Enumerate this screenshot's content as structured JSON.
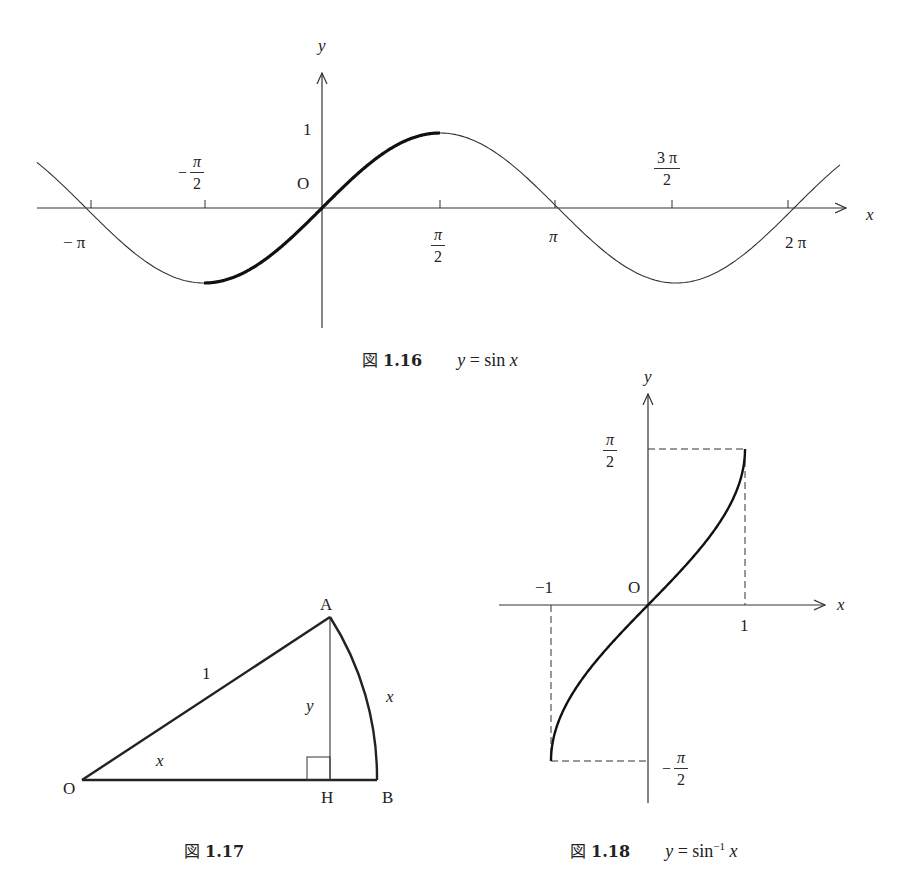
{
  "figures": {
    "fig116": {
      "caption_prefix": "図",
      "caption_number": "1.16",
      "caption_eq_lhs": "y",
      "caption_eq_rhs": " = sin ",
      "caption_eq_var": "x",
      "axis_x_label": "x",
      "axis_y_label": "y",
      "origin_label": "O",
      "y_tick_label": "1",
      "x_ticks": {
        "neg_pi": "− π",
        "neg_half_pi_sign": "−",
        "neg_half_pi_num": "π",
        "neg_half_pi_den": "2",
        "half_pi_num": "π",
        "half_pi_den": "2",
        "pi": "π",
        "three_half_pi_num": "3 π",
        "three_half_pi_den": "2",
        "two_pi": "2 π"
      }
    },
    "fig117": {
      "caption_prefix": "図",
      "caption_number": "1.17",
      "points": {
        "O": "O",
        "A": "A",
        "H": "H",
        "B": "B"
      },
      "labels": {
        "hypotenuse": "1",
        "height": "y",
        "arc": "x",
        "angle": "x"
      }
    },
    "fig118": {
      "caption_prefix": "図",
      "caption_number": "1.18",
      "caption_eq_lhs": "y",
      "caption_eq_rhs": " = sin",
      "caption_eq_sup": "−1",
      "caption_eq_var": "x",
      "axis_x_label": "x",
      "axis_y_label": "y",
      "origin_label": "O",
      "x_tick_neg1": "−1",
      "x_tick_pos1": "1",
      "y_tick_pos_num": "π",
      "y_tick_pos_den": "2",
      "y_tick_neg_sign": "−",
      "y_tick_neg_num": "π",
      "y_tick_neg_den": "2"
    }
  },
  "chart_data": [
    {
      "type": "line",
      "title": "図 1.16  y = sin x",
      "xlabel": "x",
      "ylabel": "y",
      "x_tick_labels": [
        "−π",
        "−π/2",
        "π/2",
        "π",
        "3π/2",
        "2π"
      ],
      "x_tick_values": [
        -3.1416,
        -1.5708,
        1.5708,
        3.1416,
        4.7124,
        6.2832
      ],
      "y_tick_labels": [
        "1"
      ],
      "xlim": [
        -4.0,
        6.8
      ],
      "ylim": [
        -1,
        1
      ],
      "grid": false,
      "series": [
        {
          "name": "sin x (thin)",
          "x": [
            -4.0,
            -3.1416,
            -1.5708,
            0,
            1.5708,
            3.1416,
            4.7124,
            6.2832,
            6.8
          ],
          "y": [
            0.757,
            0,
            -1,
            0,
            1,
            0,
            -1,
            0,
            0.49
          ]
        },
        {
          "name": "sin x restricted [−π/2, π/2] (bold)",
          "x": [
            -1.5708,
            -0.7854,
            0,
            0.7854,
            1.5708
          ],
          "y": [
            -1,
            -0.707,
            0,
            0.707,
            1
          ]
        }
      ]
    },
    {
      "type": "line",
      "title": "図 1.18  y = sin⁻¹ x",
      "xlabel": "x",
      "ylabel": "y",
      "x_tick_labels": [
        "−1",
        "1"
      ],
      "y_tick_labels": [
        "π/2",
        "−π/2"
      ],
      "xlim": [
        -1,
        1
      ],
      "ylim": [
        -1.5708,
        1.5708
      ],
      "grid": false,
      "series": [
        {
          "name": "arcsin x",
          "x": [
            -1,
            -0.866,
            -0.5,
            0,
            0.5,
            0.866,
            1
          ],
          "y": [
            -1.5708,
            -1.0472,
            -0.5236,
            0,
            0.5236,
            1.0472,
            1.5708
          ]
        }
      ]
    }
  ]
}
